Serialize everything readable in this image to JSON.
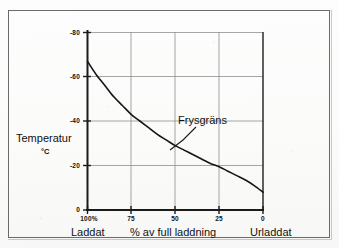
{
  "figure": {
    "border_color": "#6a6a6a",
    "background": "#fbfbfa"
  },
  "axis": {
    "y_title": "Temperatur",
    "y_unit": "°C",
    "x_left_label": "Laddat",
    "x_center_label": "% av full laddning",
    "x_right_label": "Urladdat"
  },
  "annotation": {
    "label": "Frysgräns"
  },
  "chart_data": {
    "type": "line",
    "title": "",
    "subtitle": "",
    "xlabel": "% av full laddning",
    "ylabel": "Temperatur °C",
    "xlim": [
      100,
      0
    ],
    "ylim": [
      -80,
      0
    ],
    "x_ticks": [
      100,
      75,
      50,
      25,
      0
    ],
    "x_tick_labels": [
      "100%",
      "75",
      "50",
      "25",
      "0"
    ],
    "y_ticks": [
      -80,
      -60,
      -40,
      -20,
      0
    ],
    "y_tick_labels": [
      "-80",
      "-60",
      "-40",
      "-20",
      "0"
    ],
    "grid": "both",
    "grid_color": "#8a8a8a",
    "legend": null,
    "annotations": [
      {
        "text": "Frysgräns",
        "x": 42,
        "y": -38,
        "points_to_x": 57,
        "points_to_y": -29
      }
    ],
    "series": [
      {
        "name": "Frysgräns",
        "color": "#1a1a1a",
        "x": [
          100,
          95,
          90,
          85,
          80,
          75,
          70,
          65,
          60,
          55,
          50,
          45,
          40,
          35,
          30,
          25,
          20,
          15,
          10,
          5,
          0
        ],
        "y": [
          -67,
          -61,
          -56,
          -51,
          -47,
          -43,
          -40,
          -37,
          -34,
          -31.5,
          -29,
          -27,
          -25,
          -23,
          -21,
          -19.5,
          -17.5,
          -15.5,
          -13.5,
          -11,
          -8
        ]
      }
    ]
  }
}
